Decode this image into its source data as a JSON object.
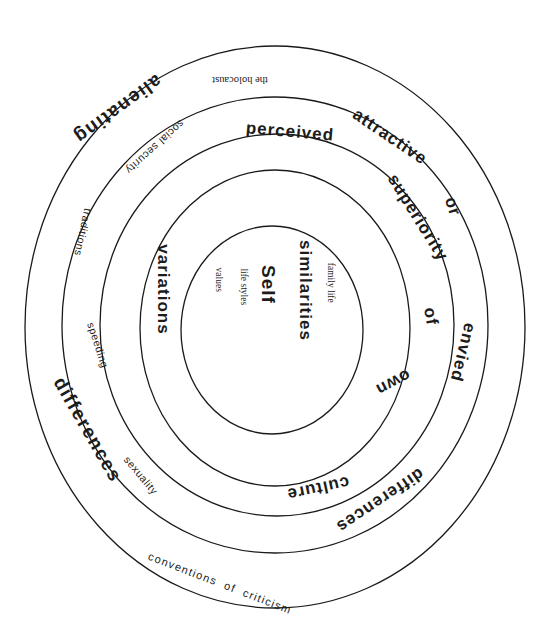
{
  "diagram": {
    "type": "concentric-rings",
    "center_label": "Self",
    "rings": [
      {
        "level": 1,
        "name": "core",
        "words": [
          "similarities",
          "Self",
          "family life",
          "life styles",
          "values"
        ]
      },
      {
        "level": 2,
        "name": "variations",
        "words": [
          "variations",
          "of",
          "own",
          "culture"
        ]
      },
      {
        "level": 3,
        "name": "perceived-superiority",
        "words": [
          "perceived",
          "superiority",
          "differences"
        ]
      },
      {
        "level": 4,
        "name": "attractive-or-envied",
        "words": [
          "attractive",
          "or",
          "envied",
          "social security",
          "traditions",
          "speeding",
          "sexuality"
        ]
      },
      {
        "level": 5,
        "name": "alienating-differences",
        "words": [
          "alienating",
          "differences",
          "the holocaust",
          "conventions of criticism"
        ]
      }
    ],
    "labels": {
      "the_holocaust": "the holocaust",
      "alienating": "alienating",
      "social_security": "social security",
      "perceived": "perceived",
      "attractive": "attractive",
      "superiority": "superiority",
      "or": "or",
      "traditions": "traditions",
      "variations": "variations",
      "similarities": "similarities",
      "family_life": "family life",
      "self": "Self",
      "life_styles": "life styles",
      "values": "values",
      "of": "of",
      "envied": "envied",
      "speeding": "speeding",
      "differences_left": "differences",
      "own": "own",
      "sexuality": "sexuality",
      "culture": "culture",
      "differences_right": "differences",
      "conventions_of_criticism": "conventions of criticism"
    },
    "colors": {
      "stroke": "#1a1a1a",
      "text": "#1c1c1c",
      "background": "#ffffff"
    }
  }
}
